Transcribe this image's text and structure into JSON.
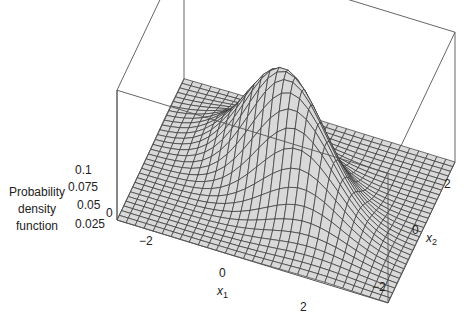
{
  "chart_data": {
    "type": "surface3d",
    "title": "",
    "function": "bivariate normal probability density",
    "zlabel": "Probability density function",
    "xlabel": "x1",
    "ylabel": "x2",
    "x_range": [
      -3,
      3
    ],
    "y_range": [
      -3,
      3
    ],
    "z_range": [
      0,
      0.1
    ],
    "x_ticks": [
      "-2",
      "0",
      "2"
    ],
    "y_ticks": [
      "-2",
      "0",
      "2"
    ],
    "z_ticks": [
      "0",
      "0.025",
      "0.05",
      "0.075",
      "0.1"
    ],
    "peak_value_approx": 0.1,
    "grid_lines_per_axis": 30,
    "box": true,
    "surface_color": "#d9d9d9",
    "mesh_color": "#333333"
  },
  "labels": {
    "zlabel_lines": [
      "Probability",
      "density",
      "function"
    ],
    "x_axis_title": "x",
    "x_axis_sub": "1",
    "y_axis_title": "x",
    "y_axis_sub": "2",
    "z_ticks": [
      "0.1",
      "0.075",
      "0.05",
      "0.025",
      "0"
    ],
    "x_ticks": [
      "−2",
      "0",
      "2"
    ],
    "y_ticks": [
      "2",
      "0",
      "−2"
    ]
  }
}
